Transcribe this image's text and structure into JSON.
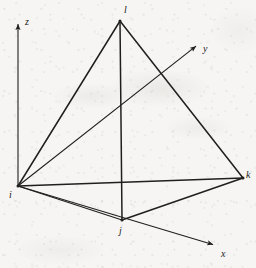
{
  "figure": {
    "caption": "",
    "stroke_color": "#211f1e",
    "background_color": "#f6f5f3"
  },
  "axes": {
    "origin_vertex": "i",
    "items": [
      {
        "id": "z",
        "label": "z",
        "name": "z-axis",
        "from": [
          18,
          186
        ],
        "to": [
          18,
          19
        ],
        "label_pos": [
          25,
          17
        ],
        "arrow": true
      },
      {
        "id": "y",
        "label": "y",
        "name": "y-axis",
        "from": [
          18,
          186
        ],
        "to": [
          200,
          43
        ],
        "label_pos": [
          203,
          44
        ],
        "arrow": true
      },
      {
        "id": "x",
        "label": "x",
        "name": "x-axis",
        "from": [
          18,
          186
        ],
        "to": [
          218,
          246
        ],
        "label_pos": [
          221,
          249
        ],
        "arrow": true
      }
    ]
  },
  "tetrahedron": {
    "name": "tetrahedral-element",
    "vertices": [
      {
        "id": "i",
        "label": "i",
        "pos": [
          18,
          186
        ],
        "label_pos": [
          9,
          190
        ]
      },
      {
        "id": "j",
        "label": "j",
        "pos": [
          122,
          220
        ],
        "label_pos": [
          119,
          226
        ]
      },
      {
        "id": "k",
        "label": "k",
        "pos": [
          243,
          178
        ],
        "label_pos": [
          246,
          170
        ]
      },
      {
        "id": "l",
        "label": "l",
        "pos": [
          120,
          21
        ],
        "label_pos": [
          124,
          5
        ]
      }
    ],
    "edges": [
      {
        "id": "il",
        "from": "i",
        "to": "l",
        "weight": 1.5
      },
      {
        "id": "jl",
        "from": "j",
        "to": "l",
        "weight": 1.5
      },
      {
        "id": "kl",
        "from": "k",
        "to": "l",
        "weight": 1.5
      },
      {
        "id": "ik",
        "from": "i",
        "to": "k",
        "weight": 1.7
      },
      {
        "id": "ij",
        "from": "i",
        "to": "j",
        "weight": 1.2
      },
      {
        "id": "jk",
        "from": "j",
        "to": "k",
        "weight": 1.5
      }
    ]
  }
}
